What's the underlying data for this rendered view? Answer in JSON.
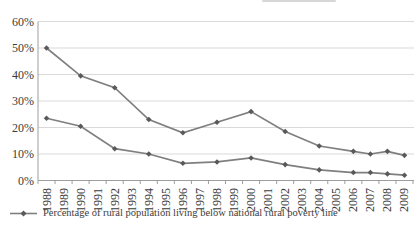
{
  "colors": {
    "background": "#ffffff",
    "series_line": "#7f7f7f",
    "series_marker": "#595959",
    "gridline": "#d9d9d9",
    "axis_line": "#9e9e9e",
    "tick_text": "#3b3b3b",
    "legend_text": "#3b3b3b",
    "artifact": "#b8b6b8"
  },
  "chart_data": {
    "type": "line",
    "title": "",
    "xlabel": "",
    "ylabel": "",
    "categories": [
      "1988",
      "1989",
      "1990",
      "1991",
      "1992",
      "1993",
      "1994",
      "1995",
      "1996",
      "1997",
      "1998",
      "1999",
      "2000",
      "2001",
      "2002",
      "2003",
      "2004",
      "2005",
      "2006",
      "2007",
      "2008",
      "2009"
    ],
    "yticks": [
      "0%",
      "10%",
      "20%",
      "30%",
      "40%",
      "50%",
      "60%"
    ],
    "ylim": [
      0,
      60
    ],
    "grid": true,
    "marker_shape": "diamond",
    "legend_position": "bottom-left",
    "series": [
      {
        "id": "upper",
        "x": [
          "1988",
          "1990",
          "1992",
          "1994",
          "1996",
          "1998",
          "2000",
          "2002",
          "2004",
          "2006",
          "2007",
          "2008",
          "2009"
        ],
        "values": [
          50,
          39.5,
          35,
          23,
          18,
          22,
          26,
          18.5,
          13,
          11,
          10,
          11,
          9.5
        ]
      },
      {
        "id": "lower",
        "x": [
          "1988",
          "1990",
          "1992",
          "1994",
          "1996",
          "1998",
          "2000",
          "2002",
          "2004",
          "2006",
          "2007",
          "2008",
          "2009"
        ],
        "values": [
          23.5,
          20.5,
          12,
          10,
          6.5,
          7,
          8.5,
          6,
          4,
          3,
          3,
          2.5,
          2
        ]
      }
    ],
    "legend": [
      {
        "marker": "line-diamond",
        "label": "Percentage of rural population living below national rural poverty line"
      }
    ]
  }
}
